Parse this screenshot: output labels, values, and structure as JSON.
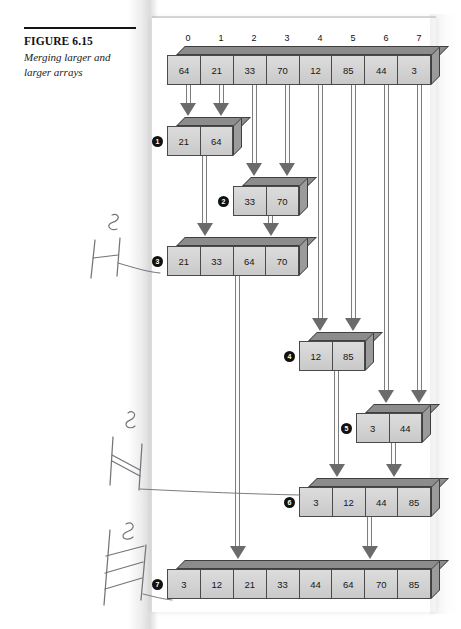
{
  "figure": {
    "number_label": "FIGURE 6.15",
    "caption": "Merging larger and larger arrays"
  },
  "chart_data": {
    "type": "diagram",
    "title": "Merging larger and larger arrays",
    "index_labels": [
      "0",
      "1",
      "2",
      "3",
      "4",
      "5",
      "6",
      "7"
    ],
    "source_array": {
      "label": "source",
      "values": [
        "64",
        "21",
        "33",
        "70",
        "12",
        "85",
        "44",
        "3"
      ]
    },
    "steps": [
      {
        "marker": "1",
        "values": [
          "21",
          "64"
        ],
        "source_indices": [
          0,
          1
        ]
      },
      {
        "marker": "2",
        "values": [
          "33",
          "70"
        ],
        "source_indices": [
          2,
          3
        ]
      },
      {
        "marker": "3",
        "values": [
          "21",
          "33",
          "64",
          "70"
        ],
        "source_indices": []
      },
      {
        "marker": "4",
        "values": [
          "12",
          "85"
        ],
        "source_indices": [
          4,
          5
        ]
      },
      {
        "marker": "5",
        "values": [
          "3",
          "44"
        ],
        "source_indices": [
          6,
          7
        ]
      },
      {
        "marker": "6",
        "values": [
          "3",
          "12",
          "44",
          "85"
        ],
        "source_indices": []
      },
      {
        "marker": "7",
        "values": [
          "3",
          "12",
          "21",
          "33",
          "44",
          "64",
          "70",
          "85"
        ],
        "source_indices": []
      }
    ]
  },
  "annotations": {
    "margin_marks": [
      {
        "name": "pencil-digit-3",
        "text": "3"
      },
      {
        "name": "pencil-digit-8-upper",
        "text": "8"
      },
      {
        "name": "pencil-digit-8-lower",
        "text": "8"
      }
    ]
  },
  "colors": {
    "box_front": "#d2d2d2",
    "box_top": "#8c8c8c",
    "box_side": "#9b9b9b",
    "box_outline": "#4a4a4a",
    "arrow": "#6b6b6b",
    "bullet": "#111111",
    "text": "#161616",
    "pencil": "#6e6e72"
  }
}
